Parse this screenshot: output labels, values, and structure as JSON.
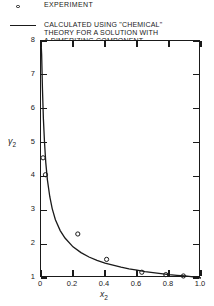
{
  "figure": {
    "legend": {
      "experiment_label": "EXPERIMENT",
      "calc_line1": "CALCULATED USING \"CHEMICAL\"",
      "calc_line2": "THEORY FOR A SOLUTION WITH",
      "calc_line3": "A DIMERIZING COMPONENT",
      "calc_line4": "( K = ∞ )"
    },
    "axis_titles": {
      "y": "γ",
      "y_sub": "2",
      "x": "x",
      "x_sub": "2"
    }
  },
  "chart_data": {
    "type": "scatter",
    "title": "",
    "xlabel": "x2",
    "ylabel": "γ2",
    "xlim": [
      0,
      1.0
    ],
    "ylim": [
      1,
      8
    ],
    "grid": false,
    "legend_position": "top-left-inside",
    "xticks": [
      "0",
      "0.2",
      "0.4",
      "0.6",
      "0.8",
      "1.0"
    ],
    "xtick_values": [
      0,
      0.2,
      0.4,
      0.6,
      0.8,
      1.0
    ],
    "yticks": [
      "1",
      "2",
      "3",
      "4",
      "5",
      "6",
      "7",
      "8"
    ],
    "ytick_values": [
      1,
      2,
      3,
      4,
      5,
      6,
      7,
      8
    ],
    "series": [
      {
        "name": "EXPERIMENT",
        "type": "scatter",
        "marker": "open-circle",
        "x": [
          0.013,
          0.028,
          0.23,
          0.41,
          0.63,
          0.78,
          0.89
        ],
        "y": [
          4.55,
          4.05,
          2.3,
          1.55,
          1.17,
          1.1,
          1.06
        ]
      },
      {
        "name": "CALCULATED USING \"CHEMICAL\" THEORY FOR A SOLUTION WITH A DIMERIZING COMPONENT ( K = ∞ )",
        "type": "line",
        "x": [
          0.0,
          0.004,
          0.009,
          0.015,
          0.022,
          0.03,
          0.04,
          0.055,
          0.07,
          0.09,
          0.12,
          0.15,
          0.2,
          0.25,
          0.3,
          0.35,
          0.4,
          0.45,
          0.5,
          0.55,
          0.6,
          0.65,
          0.7,
          0.75,
          0.8,
          0.85,
          0.9,
          0.95,
          1.0
        ],
        "y": [
          8.1,
          7.6,
          6.6,
          5.7,
          5.0,
          4.4,
          3.9,
          3.4,
          3.05,
          2.72,
          2.4,
          2.18,
          1.92,
          1.75,
          1.62,
          1.52,
          1.44,
          1.38,
          1.32,
          1.27,
          1.23,
          1.19,
          1.16,
          1.13,
          1.1,
          1.08,
          1.06,
          1.03,
          1.0
        ]
      }
    ]
  }
}
